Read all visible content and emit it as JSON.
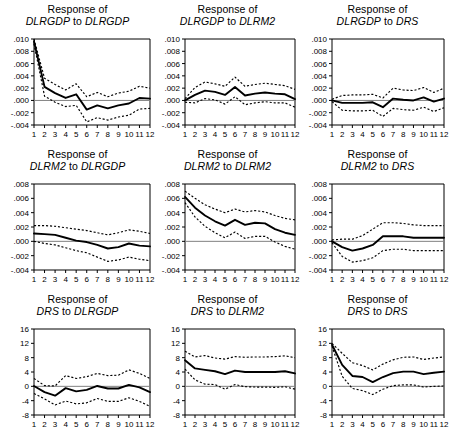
{
  "figure": {
    "title_prefix": "Response of",
    "to_word": "to",
    "panel_count": 9
  },
  "chart_data": [
    {
      "type": "line",
      "title": "Response of DLRGDP to DLRGDP",
      "response_var": "DLRGDP",
      "shock_var": "DLRGDP",
      "xlabel": "",
      "ylabel": "",
      "x": [
        1,
        2,
        3,
        4,
        5,
        6,
        7,
        8,
        9,
        10,
        11,
        12
      ],
      "xticklabels": [
        "1",
        "2",
        "3",
        "4",
        "5",
        "6",
        "7",
        "8",
        "9",
        "10",
        "11",
        "12"
      ],
      "ylim": [
        -0.004,
        0.01
      ],
      "yticks": [
        -0.004,
        -0.002,
        0.0,
        0.002,
        0.004,
        0.006,
        0.008,
        0.01
      ],
      "yticklabels": [
        "-.004",
        "-.002",
        ".000",
        ".002",
        ".004",
        ".006",
        ".008",
        ".010"
      ],
      "grid": false,
      "legend": "none",
      "series": [
        {
          "name": "impulse response",
          "style": "solid",
          "values": [
            0.0096,
            0.0022,
            0.0012,
            0.0004,
            0.001,
            -0.0015,
            -0.0008,
            -0.0013,
            -0.0008,
            -0.0005,
            0.0004,
            0.0003
          ]
        },
        {
          "name": "upper 2 S.E.",
          "style": "dashed",
          "values": [
            0.01,
            0.0036,
            0.0026,
            0.0017,
            0.0027,
            0.0006,
            0.0013,
            0.0006,
            0.0012,
            0.0015,
            0.0023,
            0.002
          ]
        },
        {
          "name": "lower 2 S.E.",
          "style": "dashed",
          "values": [
            0.0092,
            0.0007,
            -0.0003,
            -0.001,
            -0.0008,
            -0.0035,
            -0.0028,
            -0.0032,
            -0.0027,
            -0.0024,
            -0.0014,
            -0.0013
          ]
        }
      ]
    },
    {
      "type": "line",
      "title": "Response of DLRGDP to DLRM2",
      "response_var": "DLRGDP",
      "shock_var": "DLRM2",
      "xlabel": "",
      "ylabel": "",
      "x": [
        1,
        2,
        3,
        4,
        5,
        6,
        7,
        8,
        9,
        10,
        11,
        12
      ],
      "xticklabels": [
        "1",
        "2",
        "3",
        "4",
        "5",
        "6",
        "7",
        "8",
        "9",
        "10",
        "11",
        "12"
      ],
      "ylim": [
        -0.004,
        0.01
      ],
      "yticks": [
        -0.004,
        -0.002,
        0.0,
        0.002,
        0.004,
        0.006,
        0.008,
        0.01
      ],
      "yticklabels": [
        "-.004",
        "-.002",
        ".000",
        ".002",
        ".004",
        ".006",
        ".008",
        ".010"
      ],
      "grid": false,
      "legend": "none",
      "series": [
        {
          "name": "impulse response",
          "style": "solid",
          "values": [
            0.0,
            0.0009,
            0.0016,
            0.0014,
            0.0009,
            0.0022,
            0.0008,
            0.0011,
            0.0013,
            0.0011,
            0.001,
            0.0002
          ]
        },
        {
          "name": "upper 2 S.E.",
          "style": "dashed",
          "values": [
            0.0003,
            0.0021,
            0.003,
            0.0027,
            0.0023,
            0.0038,
            0.0023,
            0.0026,
            0.0028,
            0.0026,
            0.0024,
            0.0018
          ]
        },
        {
          "name": "lower 2 S.E.",
          "style": "dashed",
          "values": [
            -0.0003,
            -0.0004,
            0.0003,
            0.0001,
            -0.0006,
            0.0006,
            -0.0007,
            -0.0004,
            -0.0002,
            -0.0004,
            -0.0004,
            -0.0011
          ]
        }
      ]
    },
    {
      "type": "line",
      "title": "Response of DLRGDP to DRS",
      "response_var": "DLRGDP",
      "shock_var": "DRS",
      "xlabel": "",
      "ylabel": "",
      "x": [
        1,
        2,
        3,
        4,
        5,
        6,
        7,
        8,
        9,
        10,
        11,
        12
      ],
      "xticklabels": [
        "1",
        "2",
        "3",
        "4",
        "5",
        "6",
        "7",
        "8",
        "9",
        "10",
        "11",
        "12"
      ],
      "ylim": [
        -0.004,
        0.01
      ],
      "yticks": [
        -0.004,
        -0.002,
        0.0,
        0.002,
        0.004,
        0.006,
        0.008,
        0.01
      ],
      "yticklabels": [
        "-.004",
        "-.002",
        ".000",
        ".002",
        ".004",
        ".006",
        ".008",
        ".010"
      ],
      "grid": false,
      "legend": "none",
      "series": [
        {
          "name": "impulse response",
          "style": "solid",
          "values": [
            0.0,
            -0.0004,
            -0.0004,
            -0.0004,
            -0.0003,
            -0.0011,
            0.0003,
            0.0001,
            0.0,
            0.0005,
            -0.0002,
            0.0003
          ]
        },
        {
          "name": "upper 2 S.E.",
          "style": "dashed",
          "values": [
            0.0002,
            0.0008,
            0.0009,
            0.0009,
            0.001,
            0.0004,
            0.002,
            0.0017,
            0.0016,
            0.0021,
            0.0013,
            0.002
          ]
        },
        {
          "name": "lower 2 S.E.",
          "style": "dashed",
          "values": [
            -0.0002,
            -0.0016,
            -0.0017,
            -0.0017,
            -0.0016,
            -0.0026,
            -0.0013,
            -0.0015,
            -0.0016,
            -0.0011,
            -0.0018,
            -0.0012
          ]
        }
      ]
    },
    {
      "type": "line",
      "title": "Response of DLRM2 to DLRGDP",
      "response_var": "DLRM2",
      "shock_var": "DLRGDP",
      "xlabel": "",
      "ylabel": "",
      "x": [
        1,
        2,
        3,
        4,
        5,
        6,
        7,
        8,
        9,
        10,
        11,
        12
      ],
      "xticklabels": [
        "1",
        "2",
        "3",
        "4",
        "5",
        "6",
        "7",
        "8",
        "9",
        "10",
        "11",
        "12"
      ],
      "ylim": [
        -0.004,
        0.008
      ],
      "yticks": [
        -0.004,
        -0.002,
        0.0,
        0.002,
        0.004,
        0.006,
        0.008
      ],
      "yticklabels": [
        "-.004",
        "-.002",
        ".000",
        ".002",
        ".004",
        ".006",
        ".008"
      ],
      "grid": false,
      "legend": "none",
      "series": [
        {
          "name": "impulse response",
          "style": "solid",
          "values": [
            0.0011,
            0.001,
            0.0009,
            0.0005,
            0.0001,
            -0.0001,
            -0.0005,
            -0.001,
            -0.0008,
            -0.0003,
            -0.0006,
            -0.0007
          ]
        },
        {
          "name": "upper 2 S.E.",
          "style": "dashed",
          "values": [
            0.0022,
            0.0022,
            0.0021,
            0.0019,
            0.0017,
            0.0015,
            0.0012,
            0.0009,
            0.0012,
            0.0016,
            0.0014,
            0.0011
          ]
        },
        {
          "name": "lower 2 S.E.",
          "style": "dashed",
          "values": [
            0.0,
            -0.0003,
            -0.0005,
            -0.0009,
            -0.0013,
            -0.0016,
            -0.0022,
            -0.0028,
            -0.0026,
            -0.0022,
            -0.0025,
            -0.0027
          ]
        }
      ]
    },
    {
      "type": "line",
      "title": "Response of DLRM2 to DLRM2",
      "response_var": "DLRM2",
      "shock_var": "DLRM2",
      "xlabel": "",
      "ylabel": "",
      "x": [
        1,
        2,
        3,
        4,
        5,
        6,
        7,
        8,
        9,
        10,
        11,
        12
      ],
      "xticklabels": [
        "1",
        "2",
        "3",
        "4",
        "5",
        "6",
        "7",
        "8",
        "9",
        "10",
        "11",
        "12"
      ],
      "ylim": [
        -0.004,
        0.008
      ],
      "yticks": [
        -0.004,
        -0.002,
        0.0,
        0.002,
        0.004,
        0.006,
        0.008
      ],
      "yticklabels": [
        "-.004",
        "-.002",
        ".000",
        ".002",
        ".004",
        ".006",
        ".008"
      ],
      "grid": false,
      "legend": "none",
      "series": [
        {
          "name": "impulse response",
          "style": "solid",
          "values": [
            0.0062,
            0.0047,
            0.0036,
            0.0028,
            0.0022,
            0.003,
            0.0023,
            0.0026,
            0.0025,
            0.0017,
            0.0012,
            0.0009
          ]
        },
        {
          "name": "upper 2 S.E.",
          "style": "dashed",
          "values": [
            0.007,
            0.006,
            0.0051,
            0.0045,
            0.004,
            0.0045,
            0.0041,
            0.0043,
            0.0041,
            0.0036,
            0.0032,
            0.003
          ]
        },
        {
          "name": "lower 2 S.E.",
          "style": "dashed",
          "values": [
            0.0054,
            0.0034,
            0.0021,
            0.0012,
            0.0005,
            0.0013,
            0.0004,
            0.0007,
            0.0007,
            -0.0001,
            -0.0007,
            -0.0011
          ]
        }
      ]
    },
    {
      "type": "line",
      "title": "Response of DLRM2 to DRS",
      "response_var": "DLRM2",
      "shock_var": "DRS",
      "xlabel": "",
      "ylabel": "",
      "x": [
        1,
        2,
        3,
        4,
        5,
        6,
        7,
        8,
        9,
        10,
        11,
        12
      ],
      "xticklabels": [
        "1",
        "2",
        "3",
        "4",
        "5",
        "6",
        "7",
        "8",
        "9",
        "10",
        "11",
        "12"
      ],
      "ylim": [
        -0.004,
        0.008
      ],
      "yticks": [
        -0.004,
        -0.002,
        0.0,
        0.002,
        0.004,
        0.006,
        0.008
      ],
      "yticklabels": [
        "-.004",
        "-.002",
        ".000",
        ".002",
        ".004",
        ".006",
        ".008"
      ],
      "grid": false,
      "legend": "none",
      "series": [
        {
          "name": "impulse response",
          "style": "solid",
          "values": [
            0.0,
            -0.0008,
            -0.0013,
            -0.001,
            -0.0005,
            0.0007,
            0.0007,
            0.0007,
            0.0005,
            0.0005,
            0.0005,
            0.0005
          ]
        },
        {
          "name": "upper 2 S.E.",
          "style": "dashed",
          "values": [
            0.0002,
            0.0003,
            0.0003,
            0.0008,
            0.0017,
            0.0026,
            0.0026,
            0.0025,
            0.0023,
            0.0022,
            0.0022,
            0.0022
          ]
        },
        {
          "name": "lower 2 S.E.",
          "style": "dashed",
          "values": [
            -0.0002,
            -0.0021,
            -0.0029,
            -0.0027,
            -0.0023,
            -0.0013,
            -0.0011,
            -0.0011,
            -0.0013,
            -0.0013,
            -0.0013,
            -0.0013
          ]
        }
      ]
    },
    {
      "type": "line",
      "title": "Response of DRS to DLRGDP",
      "response_var": "DRS",
      "shock_var": "DLRGDP",
      "xlabel": "",
      "ylabel": "",
      "x": [
        1,
        2,
        3,
        4,
        5,
        6,
        7,
        8,
        9,
        10,
        11,
        12
      ],
      "xticklabels": [
        "1",
        "2",
        "3",
        "4",
        "5",
        "6",
        "7",
        "8",
        "9",
        "10",
        "11",
        "12"
      ],
      "ylim": [
        -8,
        16
      ],
      "yticks": [
        -8,
        -4,
        0,
        4,
        8,
        12,
        16
      ],
      "yticklabels": [
        "-8",
        "-4",
        "0",
        "4",
        "8",
        "12",
        "16"
      ],
      "grid": false,
      "legend": "none",
      "series": [
        {
          "name": "impulse response",
          "style": "solid",
          "values": [
            0.1,
            -1.6,
            -2.6,
            -0.5,
            -1.4,
            -1.0,
            0.1,
            -0.6,
            -0.6,
            0.4,
            -0.3,
            -1.6
          ]
        },
        {
          "name": "upper 2 S.E.",
          "style": "dashed",
          "values": [
            2.2,
            0.2,
            0.1,
            3.0,
            2.2,
            2.7,
            3.6,
            3.0,
            3.1,
            4.6,
            3.6,
            2.2
          ]
        },
        {
          "name": "lower 2 S.E.",
          "style": "dashed",
          "values": [
            -2.0,
            -3.5,
            -5.2,
            -4.1,
            -4.9,
            -4.6,
            -3.4,
            -4.2,
            -4.2,
            -3.2,
            -4.2,
            -5.6
          ]
        }
      ]
    },
    {
      "type": "line",
      "title": "Response of DRS to DLRM2",
      "response_var": "DRS",
      "shock_var": "DLRM2",
      "xlabel": "",
      "ylabel": "",
      "x": [
        1,
        2,
        3,
        4,
        5,
        6,
        7,
        8,
        9,
        10,
        11,
        12
      ],
      "xticklabels": [
        "1",
        "2",
        "3",
        "4",
        "5",
        "6",
        "7",
        "8",
        "9",
        "10",
        "11",
        "12"
      ],
      "ylim": [
        -8,
        16
      ],
      "yticks": [
        -8,
        -4,
        0,
        4,
        8,
        12,
        16
      ],
      "yticklabels": [
        "-8",
        "-4",
        "0",
        "4",
        "8",
        "12",
        "16"
      ],
      "grid": false,
      "legend": "none",
      "series": [
        {
          "name": "impulse response",
          "style": "solid",
          "values": [
            7.3,
            5.0,
            4.6,
            4.2,
            3.4,
            4.4,
            4.0,
            4.0,
            4.0,
            4.0,
            4.2,
            3.6
          ]
        },
        {
          "name": "upper 2 S.E.",
          "style": "dashed",
          "values": [
            9.8,
            8.2,
            8.6,
            7.9,
            7.6,
            8.3,
            8.1,
            8.2,
            8.2,
            8.3,
            8.5,
            8.0
          ]
        },
        {
          "name": "lower 2 S.E.",
          "style": "dashed",
          "values": [
            4.8,
            1.8,
            0.6,
            0.5,
            -0.8,
            0.5,
            -0.1,
            -0.2,
            -0.2,
            -0.3,
            -0.1,
            -0.8
          ]
        }
      ]
    },
    {
      "type": "line",
      "title": "Response of DRS to DRS",
      "response_var": "DRS",
      "shock_var": "DRS",
      "xlabel": "",
      "ylabel": "",
      "x": [
        1,
        2,
        3,
        4,
        5,
        6,
        7,
        8,
        9,
        10,
        11,
        12
      ],
      "xticklabels": [
        "1",
        "2",
        "3",
        "4",
        "5",
        "6",
        "7",
        "8",
        "9",
        "10",
        "11",
        "12"
      ],
      "ylim": [
        -8,
        16
      ],
      "yticks": [
        -8,
        -4,
        0,
        4,
        8,
        12,
        16
      ],
      "yticklabels": [
        "-8",
        "-4",
        "0",
        "4",
        "8",
        "12",
        "16"
      ],
      "grid": false,
      "legend": "none",
      "series": [
        {
          "name": "impulse response",
          "style": "solid",
          "values": [
            11.6,
            6.0,
            2.9,
            2.6,
            1.2,
            2.6,
            3.7,
            4.1,
            4.1,
            3.4,
            3.8,
            4.1
          ]
        },
        {
          "name": "upper 2 S.E.",
          "style": "dashed",
          "values": [
            12.0,
            9.2,
            6.6,
            5.8,
            4.6,
            6.2,
            7.4,
            8.1,
            8.2,
            7.5,
            7.9,
            8.2
          ]
        },
        {
          "name": "lower 2 S.E.",
          "style": "dashed",
          "values": [
            11.2,
            2.8,
            -0.6,
            -1.2,
            -2.3,
            -0.8,
            0.2,
            0.4,
            0.4,
            -0.2,
            0.0,
            0.1
          ]
        }
      ]
    }
  ]
}
